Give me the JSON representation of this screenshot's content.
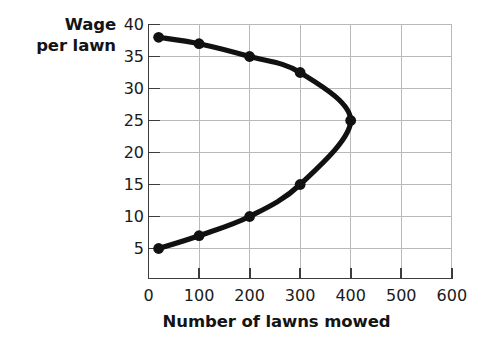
{
  "chart_data": {
    "type": "line",
    "title": "",
    "xlabel": "Number of lawns mowed",
    "ylabel": "Wage per lawn",
    "ylabel_lines": [
      "Wage",
      "per lawn"
    ],
    "xlim": [
      0,
      600
    ],
    "ylim": [
      0,
      40
    ],
    "xticks": [
      0,
      100,
      200,
      300,
      400,
      500,
      600
    ],
    "xtick_labels": [
      "0",
      "100",
      "200",
      "300",
      "400",
      "500",
      "600"
    ],
    "yticks": [
      5,
      10,
      15,
      20,
      25,
      30,
      35,
      40
    ],
    "ytick_labels": [
      "5",
      "10",
      "15",
      "20",
      "25",
      "30",
      "35",
      "40"
    ],
    "grid": true,
    "grid_color": "#b9b9b9",
    "legend": "none",
    "series": [
      {
        "name": "Wage per lawn vs lawns mowed",
        "orientation": "sideways-parabola",
        "line_color": "#111111",
        "marker": "circle",
        "marker_color": "#111111",
        "points": [
          {
            "x": 20,
            "y": 38
          },
          {
            "x": 100,
            "y": 37
          },
          {
            "x": 200,
            "y": 35
          },
          {
            "x": 300,
            "y": 32.5
          },
          {
            "x": 400,
            "y": 25
          },
          {
            "x": 300,
            "y": 15
          },
          {
            "x": 200,
            "y": 10
          },
          {
            "x": 100,
            "y": 7
          },
          {
            "x": 20,
            "y": 5
          }
        ],
        "upper_branch": [
          {
            "x": 20,
            "y": 38
          },
          {
            "x": 100,
            "y": 37
          },
          {
            "x": 200,
            "y": 35
          },
          {
            "x": 300,
            "y": 32.5
          },
          {
            "x": 400,
            "y": 25
          }
        ],
        "lower_branch": [
          {
            "x": 20,
            "y": 5
          },
          {
            "x": 100,
            "y": 7
          },
          {
            "x": 200,
            "y": 10
          },
          {
            "x": 300,
            "y": 15
          },
          {
            "x": 400,
            "y": 25
          }
        ],
        "vertex": {
          "x": 400,
          "y": 25
        }
      }
    ]
  },
  "axes": {
    "axis_color": "#3c3c3c",
    "tick_color": "#3c3c3c"
  }
}
